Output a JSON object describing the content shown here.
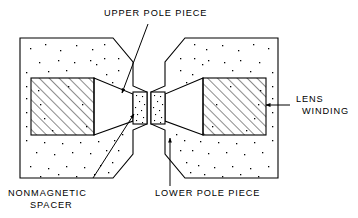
{
  "figure": {
    "type": "cross-section-diagram",
    "background_color": "#ffffff",
    "line_color": "#000000"
  },
  "labels": {
    "upper_pole_piece": "UPPER POLE PIECE",
    "lower_pole_piece": "LOWER POLE PIECE",
    "nonmagnetic_spacer_line1": "NONMAGNETIC",
    "nonmagnetic_spacer_line2": "SPACER",
    "lens_winding_line1": "LENS",
    "lens_winding_line2": "WINDING"
  },
  "parts": {
    "upper_body": {
      "name": "upper pole piece body",
      "fill_pattern": "stipple",
      "points": "20,38 113,38 133,62 133,86 147,92 147,124 133,130 133,154 113,178 20,178"
    },
    "lower_body": {
      "name": "lower pole piece body",
      "fill_pattern": "stipple",
      "points": "278,38 185,38 165,62 165,86 151,92 151,124 165,130 165,154 185,178 278,178"
    },
    "upper_winding": {
      "name": "upper lens winding",
      "fill_pattern": "diagonal-hatch",
      "x": 31,
      "y": 78,
      "width": 63,
      "height": 57
    },
    "lower_winding": {
      "name": "lower lens winding",
      "fill_pattern": "diagonal-hatch",
      "x": 203,
      "y": 78,
      "width": 63,
      "height": 57
    },
    "upper_taper": {
      "name": "upper pole tip taper",
      "points": "94,78 133,94 133,121 94,135"
    },
    "lower_taper": {
      "name": "lower pole tip taper",
      "points": "203,78 165,94 165,121 203,135"
    },
    "upper_spacer": {
      "name": "upper nonmagnetic spacer",
      "fill_pattern": "stipple",
      "x": 133,
      "y": 92,
      "width": 14,
      "height": 32
    },
    "lower_spacer": {
      "name": "lower nonmagnetic spacer",
      "fill_pattern": "stipple",
      "x": 151,
      "y": 92,
      "width": 14,
      "height": 32
    },
    "gap": {
      "name": "lens gap",
      "x": 147,
      "y": 92,
      "width": 4,
      "height": 32
    }
  },
  "leaders": {
    "upper_pole_piece": {
      "path": "M 148,24 L 122,93",
      "arrow_at": "122,93",
      "arrow_angle": 110
    },
    "nonmagnetic_spacer": {
      "path": "M 93,178 L 134,114",
      "arrow_at": "134,114",
      "arrow_angle": -57
    },
    "lower_pole_piece": {
      "path": "M 170,186 L 170,138",
      "arrow_at": "170,138",
      "arrow_angle": -90
    },
    "lens_winding": {
      "path": "M 290,105 L 266,105",
      "arrow_at": "266,105",
      "arrow_angle": 180
    }
  },
  "label_positions": {
    "upper_pole_piece": {
      "x": 104,
      "y": 16
    },
    "nonmagnetic_spacer": {
      "x": 8,
      "y": 196
    },
    "lower_pole_piece": {
      "x": 155,
      "y": 196
    },
    "lens_winding": {
      "x": 296,
      "y": 102
    }
  },
  "stipple_dots": {
    "note": "random speckle fill representing cast/solid metal body",
    "upper": [
      [
        30,
        48
      ],
      [
        45,
        44
      ],
      [
        60,
        50
      ],
      [
        76,
        45
      ],
      [
        92,
        49
      ],
      [
        104,
        44
      ],
      [
        58,
        60
      ],
      [
        39,
        62
      ],
      [
        74,
        62
      ],
      [
        90,
        60
      ],
      [
        104,
        58
      ],
      [
        118,
        58
      ],
      [
        26,
        72
      ],
      [
        48,
        71
      ],
      [
        66,
        70
      ],
      [
        118,
        70
      ],
      [
        26,
        86
      ],
      [
        106,
        74
      ],
      [
        112,
        82
      ],
      [
        26,
        98
      ],
      [
        118,
        88
      ],
      [
        124,
        98
      ],
      [
        115,
        104
      ],
      [
        104,
        110
      ],
      [
        26,
        112
      ],
      [
        118,
        116
      ],
      [
        26,
        126
      ],
      [
        110,
        126
      ],
      [
        124,
        120
      ],
      [
        26,
        140
      ],
      [
        44,
        142
      ],
      [
        62,
        143
      ],
      [
        80,
        142
      ],
      [
        98,
        141
      ],
      [
        114,
        140
      ],
      [
        122,
        134
      ],
      [
        36,
        152
      ],
      [
        54,
        154
      ],
      [
        72,
        152
      ],
      [
        90,
        153
      ],
      [
        106,
        150
      ],
      [
        118,
        150
      ],
      [
        30,
        166
      ],
      [
        48,
        168
      ],
      [
        66,
        166
      ],
      [
        84,
        167
      ],
      [
        100,
        165
      ],
      [
        112,
        162
      ],
      [
        40,
        176
      ],
      [
        58,
        174
      ],
      [
        76,
        176
      ],
      [
        94,
        174
      ],
      [
        108,
        172
      ],
      [
        38,
        90
      ],
      [
        40,
        104
      ],
      [
        44,
        118
      ],
      [
        52,
        130
      ],
      [
        86,
        126
      ],
      [
        96,
        64
      ],
      [
        68,
        86
      ],
      [
        82,
        104
      ]
    ],
    "lower": [
      [
        268,
        48
      ],
      [
        253,
        44
      ],
      [
        238,
        50
      ],
      [
        222,
        45
      ],
      [
        206,
        49
      ],
      [
        194,
        44
      ],
      [
        240,
        60
      ],
      [
        259,
        62
      ],
      [
        224,
        62
      ],
      [
        208,
        60
      ],
      [
        194,
        58
      ],
      [
        180,
        58
      ],
      [
        272,
        72
      ],
      [
        250,
        71
      ],
      [
        232,
        70
      ],
      [
        180,
        70
      ],
      [
        272,
        86
      ],
      [
        192,
        74
      ],
      [
        186,
        82
      ],
      [
        272,
        98
      ],
      [
        180,
        88
      ],
      [
        174,
        98
      ],
      [
        183,
        104
      ],
      [
        194,
        110
      ],
      [
        272,
        112
      ],
      [
        180,
        116
      ],
      [
        272,
        126
      ],
      [
        188,
        126
      ],
      [
        174,
        120
      ],
      [
        272,
        140
      ],
      [
        254,
        142
      ],
      [
        236,
        143
      ],
      [
        218,
        142
      ],
      [
        200,
        141
      ],
      [
        184,
        140
      ],
      [
        176,
        134
      ],
      [
        262,
        152
      ],
      [
        244,
        154
      ],
      [
        226,
        152
      ],
      [
        208,
        153
      ],
      [
        192,
        150
      ],
      [
        180,
        150
      ],
      [
        268,
        166
      ],
      [
        250,
        168
      ],
      [
        232,
        166
      ],
      [
        214,
        167
      ],
      [
        198,
        165
      ],
      [
        186,
        162
      ],
      [
        258,
        176
      ],
      [
        240,
        174
      ],
      [
        222,
        176
      ],
      [
        204,
        174
      ],
      [
        190,
        172
      ],
      [
        260,
        90
      ],
      [
        258,
        104
      ],
      [
        254,
        118
      ],
      [
        246,
        130
      ],
      [
        212,
        126
      ],
      [
        202,
        64
      ],
      [
        230,
        86
      ],
      [
        216,
        104
      ]
    ],
    "upper_spacer": [
      [
        136,
        95
      ],
      [
        142,
        96
      ],
      [
        139,
        101
      ],
      [
        144,
        104
      ],
      [
        135,
        107
      ],
      [
        141,
        110
      ],
      [
        137,
        114
      ],
      [
        143,
        117
      ],
      [
        136,
        120
      ],
      [
        142,
        122
      ]
    ],
    "lower_spacer": [
      [
        154,
        95
      ],
      [
        160,
        96
      ],
      [
        157,
        101
      ],
      [
        162,
        104
      ],
      [
        153,
        107
      ],
      [
        159,
        110
      ],
      [
        155,
        114
      ],
      [
        161,
        117
      ],
      [
        154,
        120
      ],
      [
        160,
        122
      ]
    ]
  }
}
